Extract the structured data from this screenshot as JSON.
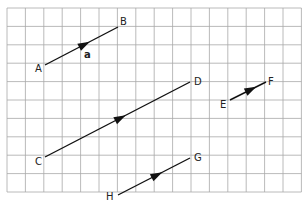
{
  "grid": {
    "origin_x": 7,
    "origin_y": 8,
    "cols": 16,
    "rows": 10,
    "cell": 18.4,
    "line_color": "#a8a8a8",
    "border_color": "#9a9a9a"
  },
  "vectors": [
    {
      "id": "AB",
      "from": "A",
      "to": "B",
      "x1": 45,
      "y1": 65,
      "x2": 118,
      "y2": 27,
      "label": "a",
      "label_x": 84,
      "label_y": 50
    },
    {
      "id": "CD",
      "from": "C",
      "to": "D",
      "x1": 45,
      "y1": 157,
      "x2": 190,
      "y2": 82
    },
    {
      "id": "EF",
      "from": "E",
      "to": "F",
      "x1": 230,
      "y1": 100,
      "x2": 266,
      "y2": 82
    },
    {
      "id": "HG",
      "from": "H",
      "to": "G",
      "x1": 118,
      "y1": 195,
      "x2": 190,
      "y2": 158
    }
  ],
  "points": [
    {
      "name": "A",
      "x": 35,
      "y": 64
    },
    {
      "name": "B",
      "x": 120,
      "y": 17
    },
    {
      "name": "C",
      "x": 35,
      "y": 157
    },
    {
      "name": "D",
      "x": 194,
      "y": 77
    },
    {
      "name": "E",
      "x": 220,
      "y": 100
    },
    {
      "name": "F",
      "x": 268,
      "y": 77
    },
    {
      "name": "G",
      "x": 194,
      "y": 153
    },
    {
      "name": "H",
      "x": 106,
      "y": 192
    }
  ],
  "vector_label": "a",
  "stroke_color": "#111111"
}
